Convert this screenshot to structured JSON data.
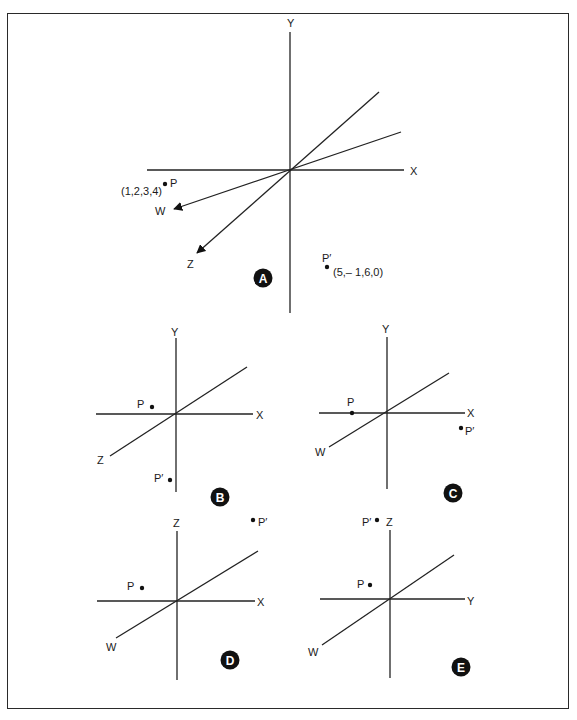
{
  "figure": {
    "panels": [
      {
        "id": "A",
        "badge": "A",
        "axes": [
          "X",
          "Y",
          "Z",
          "W"
        ],
        "points": [
          {
            "name": "P",
            "coords": "(1,2,3,4)"
          },
          {
            "name": "P′",
            "coords": "(5,– 1,6,0)"
          }
        ]
      },
      {
        "id": "B",
        "badge": "B",
        "axes": [
          "X",
          "Y",
          "Z"
        ],
        "points": [
          {
            "name": "P"
          },
          {
            "name": "P′"
          }
        ]
      },
      {
        "id": "C",
        "badge": "C",
        "axes": [
          "X",
          "Y",
          "W"
        ],
        "points": [
          {
            "name": "P"
          },
          {
            "name": "P′"
          }
        ]
      },
      {
        "id": "D",
        "badge": "D",
        "axes": [
          "X",
          "Z",
          "W"
        ],
        "points": [
          {
            "name": "P"
          },
          {
            "name": "P′"
          }
        ]
      },
      {
        "id": "E",
        "badge": "E",
        "axes": [
          "Y",
          "Z",
          "W"
        ],
        "points": [
          {
            "name": "P"
          },
          {
            "name": "P′"
          }
        ]
      }
    ]
  },
  "labels": {
    "A": {
      "y": "Y",
      "x": "X",
      "w": "W",
      "z": "Z",
      "p": "P",
      "p_coords": "(1,2,3,4)",
      "pp": "P′",
      "pp_coords": "(5,– 1,6,0)",
      "badge": "A"
    },
    "B": {
      "y": "Y",
      "x": "X",
      "z": "Z",
      "p": "P",
      "pp": "P′",
      "badge": "B"
    },
    "C": {
      "y": "Y",
      "x": "X",
      "w": "W",
      "p": "P",
      "pp": "P′",
      "badge": "C"
    },
    "D": {
      "z": "Z",
      "x": "X",
      "w": "W",
      "p": "P",
      "pp": "P′",
      "badge": "D"
    },
    "E": {
      "z": "Z",
      "y": "Y",
      "w": "W",
      "p": "P",
      "pp": "P′",
      "badge": "E"
    }
  },
  "colors": {
    "ink": "#222222",
    "badge_fill": "#111111",
    "background": "#ffffff"
  }
}
